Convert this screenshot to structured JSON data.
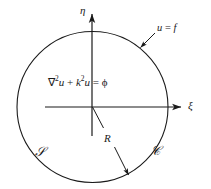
{
  "figure": {
    "type": "diagram",
    "background_color": "#ffffff",
    "stroke_color": "#1a1a1a"
  },
  "axes": {
    "vertical": {
      "name": "eta-axis",
      "label": "η",
      "label_x": 82,
      "label_y": 6,
      "x": 92,
      "y_top": 14,
      "y_bottom": 136
    },
    "horizontal": {
      "name": "xi-axis",
      "label": "ξ",
      "label_x": 188,
      "label_y": 101,
      "y": 107,
      "x_left": 45,
      "x_right": 181
    }
  },
  "circle": {
    "name": "boundary-circle",
    "cx": 92.5,
    "cy": 107,
    "r": 75.5
  },
  "equation": {
    "nabla": "∇",
    "sup2_a": "2",
    "u_a": "u",
    "plus": " + ",
    "k": "k",
    "sup2_b": "2",
    "u_b": "u",
    "equals": " = ",
    "phi": "ϕ",
    "full_text": "∇2u + k2u = ϕ",
    "x": 48,
    "y": 78
  },
  "boundary_condition": {
    "name": "boundary-condition-label",
    "u": "u",
    "equals": " = ",
    "f": "f",
    "x": 157,
    "y": 24,
    "arrow": {
      "x1": 155,
      "y1": 33,
      "x2": 140.5,
      "y2": 47.5
    }
  },
  "radius": {
    "name": "radius-label",
    "label": "R",
    "x": 104,
    "y": 134,
    "line": {
      "x1": 92.5,
      "y1": 107,
      "x2": 103,
      "y2": 127
    },
    "arrow": {
      "x1": 115,
      "y1": 148,
      "x2": 128.5,
      "y2": 175
    }
  },
  "region_label": {
    "name": "region-S-label",
    "text": "𝒮",
    "fallback": "S",
    "x": 36,
    "y": 149
  },
  "contour_label": {
    "name": "contour-C-label",
    "text": "𝒞",
    "fallback": "C",
    "x": 152,
    "y": 148
  }
}
